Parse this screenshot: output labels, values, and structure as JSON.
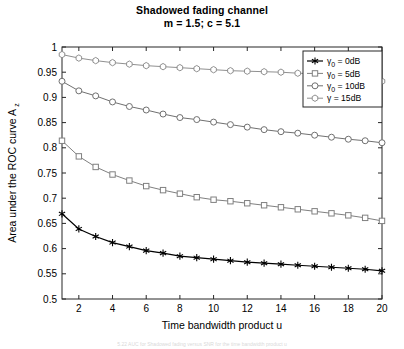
{
  "figure": {
    "title_line1": "Shadowed fading channel",
    "title_line2": "m = 1.5; c = 5.1",
    "bottom_caption": "5.22   AUC for Shadowed fading versus SNR for the time bandwidth product u"
  },
  "axes": {
    "xlabel": "Time bandwidth product u",
    "ylabel_main": "Area under the ROC curve A",
    "ylabel_sub": "z",
    "xticks": [
      "2",
      "4",
      "6",
      "8",
      "10",
      "12",
      "14",
      "16",
      "18",
      "20"
    ],
    "yticks": [
      "0.5",
      "0.55",
      "0.6",
      "0.65",
      "0.7",
      "0.75",
      "0.8",
      "0.85",
      "0.9",
      "0.95",
      "1"
    ]
  },
  "legend": {
    "items": [
      {
        "label_pre": "γ",
        "label_sub": "0",
        "label_post": " = 0dB",
        "marker": "star-marker",
        "color": "#000000"
      },
      {
        "label_pre": "γ",
        "label_sub": "0",
        "label_post": " = 5dB",
        "marker": "square-marker",
        "color": "#808080"
      },
      {
        "label_pre": "γ",
        "label_sub": "0",
        "label_post": " = 10dB",
        "marker": "circle-marker",
        "color": "#707070"
      },
      {
        "label_pre": "γ",
        "label_sub": "",
        "label_post": " = 15dB",
        "marker": "hexagon-marker",
        "color": "#909090"
      }
    ]
  },
  "chart_data": {
    "type": "line",
    "title": "Shadowed fading channel m = 1.5; c = 5.1",
    "xlabel": "Time bandwidth product u",
    "ylabel": "Area under the ROC curve A_z",
    "xlim": [
      1,
      20
    ],
    "ylim": [
      0.5,
      1
    ],
    "grid": false,
    "legend_position": "upper right",
    "x": [
      1,
      2,
      3,
      4,
      5,
      6,
      7,
      8,
      9,
      10,
      11,
      12,
      13,
      14,
      15,
      16,
      17,
      18,
      19,
      20
    ],
    "series": [
      {
        "name": "γ₀ = 0dB",
        "marker": "star",
        "color": "#000000",
        "values": [
          0.669,
          0.639,
          0.624,
          0.612,
          0.604,
          0.596,
          0.591,
          0.585,
          0.582,
          0.579,
          0.576,
          0.573,
          0.571,
          0.569,
          0.567,
          0.565,
          0.563,
          0.561,
          0.559,
          0.556
        ]
      },
      {
        "name": "γ₀ = 5dB",
        "marker": "square",
        "color": "#808080",
        "values": [
          0.814,
          0.783,
          0.762,
          0.747,
          0.735,
          0.724,
          0.716,
          0.709,
          0.702,
          0.697,
          0.694,
          0.69,
          0.686,
          0.682,
          0.678,
          0.674,
          0.67,
          0.666,
          0.661,
          0.655
        ]
      },
      {
        "name": "γ₀ = 10dB",
        "marker": "circle",
        "color": "#707070",
        "values": [
          0.932,
          0.913,
          0.903,
          0.891,
          0.882,
          0.875,
          0.867,
          0.86,
          0.856,
          0.851,
          0.846,
          0.841,
          0.836,
          0.832,
          0.829,
          0.825,
          0.821,
          0.817,
          0.814,
          0.81
        ]
      },
      {
        "name": "γ = 15dB",
        "marker": "hexagon",
        "color": "#909090",
        "values": [
          0.985,
          0.978,
          0.973,
          0.969,
          0.966,
          0.963,
          0.961,
          0.959,
          0.957,
          0.955,
          0.953,
          0.952,
          0.951,
          0.95,
          0.948,
          0.947,
          0.946,
          0.944,
          0.943,
          0.932
        ]
      }
    ]
  }
}
